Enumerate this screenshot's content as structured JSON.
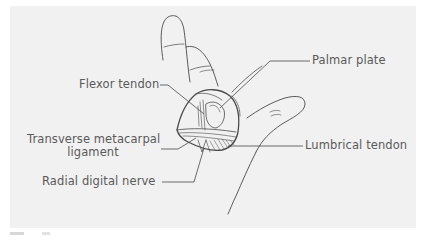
{
  "figure": {
    "colors": {
      "panel_background": "#f1f1f1",
      "line": "#4a4a4a",
      "label_text": "#5a5a5a"
    },
    "labels": [
      {
        "id": "flexor-tendon",
        "text": "Flexor tendon"
      },
      {
        "id": "palmar-plate",
        "text": "Palmar plate"
      },
      {
        "id": "transverse-metacarpal-ligament",
        "line1": "Transverse metacarpal",
        "line2": "ligament"
      },
      {
        "id": "lumbrical-tendon",
        "text": "Lumbrical tendon"
      },
      {
        "id": "radial-digital-nerve",
        "text": "Radial digital nerve"
      }
    ]
  }
}
